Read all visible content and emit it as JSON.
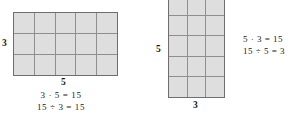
{
  "figures": [
    {
      "id": "left",
      "name": "rectangle-5-by-3",
      "grid": {
        "columns": 5,
        "rows": 3,
        "total_cells": 15
      },
      "height_label": "3",
      "width_label": "5",
      "equations": [
        "3 · 5 = 15",
        "15 ÷ 3 = 15"
      ]
    },
    {
      "id": "right",
      "name": "rectangle-3-by-5",
      "grid": {
        "columns": 3,
        "rows": 5,
        "total_cells": 15
      },
      "height_label": "5",
      "width_label": "3",
      "equations": [
        "5 · 3 = 15",
        "15 ÷ 5 = 3"
      ]
    }
  ],
  "colors": {
    "cell_fill": "#dedede",
    "grid_line": "#8f8f8f",
    "outer_border": "#6e6e6e",
    "text": "#1a1a1a",
    "background": "#ffffff"
  }
}
